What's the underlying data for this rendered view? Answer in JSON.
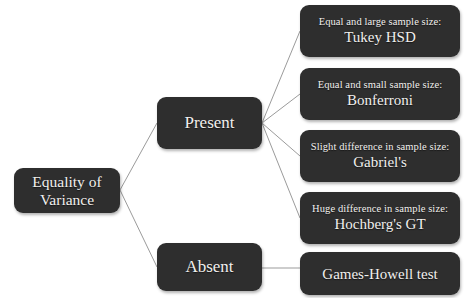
{
  "diagram": {
    "background_color": "#ffffff",
    "node_color": "#2e2e2e",
    "node_text_color": "#f2f0ee",
    "edge_color": "#9b9b9b",
    "root": {
      "id": "equality-of-variance",
      "label_line1": "Equality of",
      "label_line2": "Variance"
    },
    "branches": [
      {
        "id": "present",
        "label": "Present"
      },
      {
        "id": "absent",
        "label": "Absent"
      }
    ],
    "leaves": [
      {
        "id": "tukey-hsd",
        "parent": "present",
        "condition": "Equal and large sample size:",
        "test": "Tukey HSD"
      },
      {
        "id": "bonferroni",
        "parent": "present",
        "condition": "Equal and small sample size:",
        "test": "Bonferroni"
      },
      {
        "id": "gabriels",
        "parent": "present",
        "condition": "Slight difference in sample size:",
        "test": "Gabriel's"
      },
      {
        "id": "hochbergs-gt",
        "parent": "present",
        "condition": "Huge difference in sample size:",
        "test": "Hochberg's GT"
      },
      {
        "id": "games-howell",
        "parent": "absent",
        "condition": "",
        "test": "Games-Howell test"
      }
    ]
  }
}
